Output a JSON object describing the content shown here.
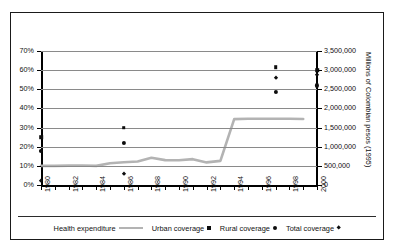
{
  "chart_data": {
    "type": "line",
    "title": "",
    "xlabel": "",
    "ylabel": "",
    "grid": true,
    "legend_position": "bottom",
    "x_axis": {
      "min": 1980,
      "max": 2000,
      "tick_interval": 1,
      "label_interval": 2,
      "tick_labels": [
        "1980",
        "1982",
        "1984",
        "1986",
        "1988",
        "1990",
        "1992",
        "1994",
        "1996",
        "1998",
        "2000"
      ]
    },
    "y_axis_left": {
      "title": "",
      "min": 0,
      "max": 70,
      "unit": "%",
      "tick_labels": [
        "0%",
        "10%",
        "20%",
        "30%",
        "40%",
        "50%",
        "60%",
        "70%"
      ],
      "tick_values": [
        0,
        10,
        20,
        30,
        40,
        50,
        60,
        70
      ]
    },
    "y_axis_right": {
      "title": "Millions of Colombian pesos (1995)",
      "min": 0,
      "max": 3500000,
      "tick_labels": [
        "0",
        "500,000",
        "1,000,000",
        "1,500,000",
        "2,000,000",
        "2,500,000",
        "3,000,000",
        "3,500,000"
      ],
      "tick_values": [
        0,
        500000,
        1000000,
        1500000,
        2000000,
        2500000,
        3000000,
        3500000
      ]
    },
    "series": [
      {
        "name": "Health expenditure",
        "type": "line",
        "axis": "right",
        "color": "#b3b3b3",
        "marker": "none",
        "points": [
          {
            "x": 1980,
            "y_pct": 10.0
          },
          {
            "x": 1981,
            "y_pct": 10.0
          },
          {
            "x": 1982,
            "y_pct": 10.1
          },
          {
            "x": 1983,
            "y_pct": 10.2
          },
          {
            "x": 1984,
            "y_pct": 10.0
          },
          {
            "x": 1985,
            "y_pct": 11.4
          },
          {
            "x": 1986,
            "y_pct": 11.9
          },
          {
            "x": 1987,
            "y_pct": 12.3
          },
          {
            "x": 1988,
            "y_pct": 14.2
          },
          {
            "x": 1989,
            "y_pct": 13.0
          },
          {
            "x": 1990,
            "y_pct": 12.9
          },
          {
            "x": 1991,
            "y_pct": 13.5
          },
          {
            "x": 1992,
            "y_pct": 11.8
          },
          {
            "x": 1993,
            "y_pct": 12.6
          },
          {
            "x": 1994,
            "y_pct": 34.4
          },
          {
            "x": 1995,
            "y_pct": 34.6
          },
          {
            "x": 1996,
            "y_pct": 34.6
          },
          {
            "x": 1997,
            "y_pct": 34.6
          },
          {
            "x": 1998,
            "y_pct": 34.6
          },
          {
            "x": 1999,
            "y_pct": 34.5
          }
        ]
      },
      {
        "name": "Urban coverage",
        "type": "scatter",
        "axis": "left",
        "color": "#0d0d0d",
        "marker": "square",
        "points": [
          {
            "x": 1980,
            "y": 25.0
          },
          {
            "x": 1986,
            "y": 30.0
          },
          {
            "x": 1997,
            "y": 61.5
          },
          {
            "x": 2000,
            "y": 60.0
          }
        ]
      },
      {
        "name": "Rural coverage",
        "type": "scatter",
        "axis": "left",
        "color": "#0d0d0d",
        "marker": "circle",
        "points": [
          {
            "x": 1980,
            "y": 18.0
          },
          {
            "x": 1986,
            "y": 22.0
          },
          {
            "x": 1997,
            "y": 48.5
          },
          {
            "x": 2000,
            "y": 52.0
          }
        ]
      },
      {
        "name": "Total coverage",
        "type": "scatter",
        "axis": "left",
        "color": "#0d0d0d",
        "marker": "diamond",
        "points": [
          {
            "x": 1980,
            "y": 2.0
          },
          {
            "x": 1986,
            "y": 6.0
          },
          {
            "x": 1997,
            "y": 56.0
          },
          {
            "x": 2000,
            "y": 57.5
          }
        ]
      }
    ],
    "legend": [
      {
        "label": "Health expenditure",
        "marker": "line",
        "color": "#b3b3b3"
      },
      {
        "label": "Urban coverage",
        "marker": "square",
        "color": "#0d0d0d"
      },
      {
        "label": "Rural coverage",
        "marker": "circle",
        "color": "#0d0d0d"
      },
      {
        "label": "Total coverage",
        "marker": "diamond",
        "color": "#0d0d0d"
      }
    ]
  }
}
